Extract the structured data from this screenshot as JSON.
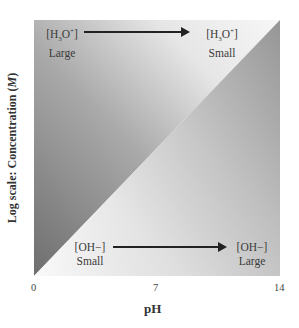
{
  "diagram": {
    "title": "",
    "top_label_left": {
      "species": "[H3O+]",
      "size": "Large"
    },
    "top_label_right": {
      "species": "[H3O+]",
      "size": "Small"
    },
    "bottom_label_left": {
      "species": "[OH−]",
      "size": "Small"
    },
    "bottom_label_right": {
      "species": "[OH−]",
      "size": "Large"
    },
    "x_axis": {
      "label": "pH",
      "ticks": [
        "0",
        "7",
        "14"
      ]
    },
    "y_axis": {
      "label_prefix": "Log scale: Concentration (",
      "label_unit": "M",
      "label_suffix": ")"
    },
    "colors": {
      "dark_gray": "#7a7a7a",
      "mid_gray": "#a8a8a8",
      "light": "#f2f2f2",
      "arrow": "#222222"
    }
  }
}
